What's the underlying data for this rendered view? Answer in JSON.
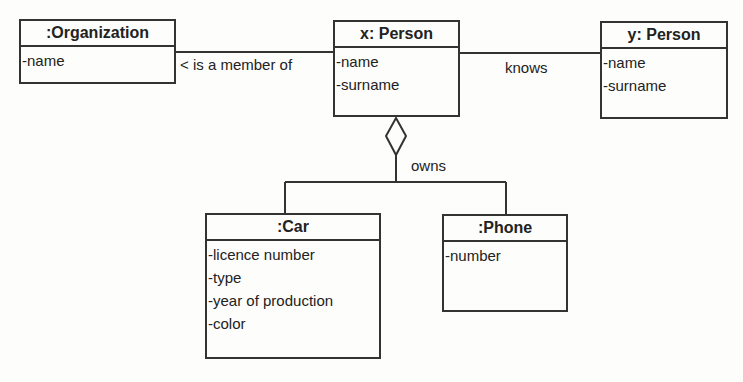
{
  "diagram": {
    "type": "UML object diagram",
    "objects": [
      {
        "id": "organization",
        "title": ":Organization",
        "attributes": [
          "-name"
        ]
      },
      {
        "id": "x-person",
        "title": "x: Person",
        "attributes": [
          "-name",
          "-surname"
        ]
      },
      {
        "id": "y-person",
        "title": "y: Person",
        "attributes": [
          "-name",
          "-surname"
        ]
      },
      {
        "id": "car",
        "title": ":Car",
        "attributes": [
          "-licence number",
          "-type",
          "-year of production",
          "-color"
        ]
      },
      {
        "id": "phone",
        "title": ":Phone",
        "attributes": [
          "-number"
        ]
      }
    ],
    "links": [
      {
        "from": "x-person",
        "to": "organization",
        "label": "< is a member of",
        "kind": "association"
      },
      {
        "from": "x-person",
        "to": "y-person",
        "label": "knows",
        "kind": "association"
      },
      {
        "from": "x-person",
        "to": [
          "car",
          "phone"
        ],
        "label": "owns",
        "kind": "aggregation"
      }
    ],
    "colors": {
      "line": "#333333",
      "background": "#fdfdfb",
      "text": "#222222"
    }
  }
}
